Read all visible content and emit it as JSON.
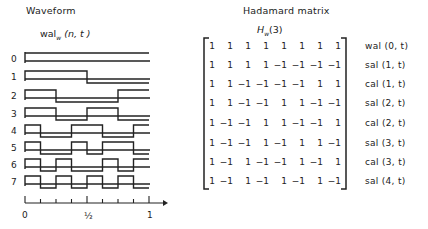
{
  "waveform": {
    "title": "Waveform",
    "subtitle_main": "wal",
    "subtitle_sub": "w",
    "subtitle_args": " (n, t )",
    "rows": [
      {
        "label": "0",
        "values": [
          1,
          1,
          1,
          1,
          1,
          1,
          1,
          1
        ]
      },
      {
        "label": "1",
        "values": [
          1,
          1,
          1,
          1,
          -1,
          -1,
          -1,
          -1
        ]
      },
      {
        "label": "2",
        "values": [
          1,
          1,
          -1,
          -1,
          -1,
          -1,
          1,
          1
        ]
      },
      {
        "label": "3",
        "values": [
          1,
          1,
          -1,
          -1,
          1,
          1,
          -1,
          -1
        ]
      },
      {
        "label": "4",
        "values": [
          1,
          -1,
          -1,
          1,
          1,
          -1,
          -1,
          1
        ]
      },
      {
        "label": "5",
        "values": [
          1,
          -1,
          -1,
          1,
          -1,
          1,
          1,
          -1
        ]
      },
      {
        "label": "6",
        "values": [
          1,
          -1,
          1,
          -1,
          -1,
          1,
          -1,
          1
        ]
      },
      {
        "label": "7",
        "values": [
          1,
          -1,
          1,
          -1,
          1,
          -1,
          1,
          -1
        ]
      }
    ],
    "axis": {
      "tick_labels": [
        "0",
        "½",
        "1"
      ],
      "ticks": 8
    }
  },
  "matrix": {
    "title": "Hadamard matrix",
    "symbol": "H",
    "symbol_sub": "w",
    "symbol_args": "(3)",
    "rows": [
      {
        "cells": [
          "1",
          "1",
          "1",
          "1",
          "1",
          "1",
          "1",
          "1"
        ],
        "function": "wal (0, t)"
      },
      {
        "cells": [
          "1",
          "1",
          "1",
          "1",
          "−1",
          "−1",
          "−1",
          "−1"
        ],
        "function": "sal (1, t)"
      },
      {
        "cells": [
          "1",
          "1",
          "−1",
          "−1",
          "−1",
          "−1",
          "1",
          "1"
        ],
        "function": "cal (1, t)"
      },
      {
        "cells": [
          "1",
          "1",
          "−1",
          "−1",
          "1",
          "1",
          "−1",
          "−1"
        ],
        "function": "sal (2, t)"
      },
      {
        "cells": [
          "1",
          "−1",
          "−1",
          "1",
          "1",
          "−1",
          "−1",
          "1"
        ],
        "function": "cal (2, t)"
      },
      {
        "cells": [
          "1",
          "−1",
          "−1",
          "1",
          "−1",
          "1",
          "1",
          "−1"
        ],
        "function": "sal (3, t)"
      },
      {
        "cells": [
          "1",
          "−1",
          "1",
          "−1",
          "−1",
          "1",
          "−1",
          "1"
        ],
        "function": "cal (3, t)"
      },
      {
        "cells": [
          "1",
          "−1",
          "1",
          "−1",
          "1",
          "−1",
          "1",
          "−1"
        ],
        "function": "sal (4, t)"
      }
    ]
  },
  "colors": {
    "ink": "#222222",
    "background": "#ffffff"
  }
}
